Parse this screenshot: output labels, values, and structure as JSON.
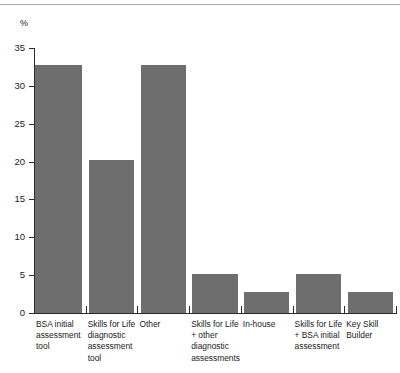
{
  "chart_data": {
    "type": "bar",
    "title": "",
    "subtitle": "",
    "xlabel": "",
    "ylabel": "%",
    "ylim": [
      0,
      35
    ],
    "ytick_labels": [
      "0",
      "5",
      "10",
      "15",
      "20",
      "25",
      "30",
      "35"
    ],
    "ytick_values": [
      0,
      5,
      10,
      15,
      20,
      25,
      30,
      35
    ],
    "grid": false,
    "legend": false,
    "bar_color": "#6e6e6e",
    "categories": [
      "BSA initial assessment tool",
      "Skills for Life diagnostic assessment tool",
      "Other",
      "Skills for Life + other diagnostic assessments",
      "In-house",
      "Skills for Life + BSA initial assessment",
      "Key Skill Builder"
    ],
    "category_label_lines": [
      [
        "BSA initial",
        "assessment",
        "tool"
      ],
      [
        "Skills for Life",
        "diagnostic",
        "assessment",
        "tool"
      ],
      [
        "Other"
      ],
      [
        "Skills for Life",
        "+ other",
        "diagnostic",
        "assessments"
      ],
      [
        "In-house"
      ],
      [
        "Skills for Life",
        "+ BSA initial",
        "assessment"
      ],
      [
        "Key Skill",
        "Builder"
      ]
    ],
    "values": [
      32.7,
      20.2,
      32.7,
      5.2,
      2.8,
      5.2,
      2.8
    ]
  },
  "axis": {
    "unit_caption": "%"
  }
}
